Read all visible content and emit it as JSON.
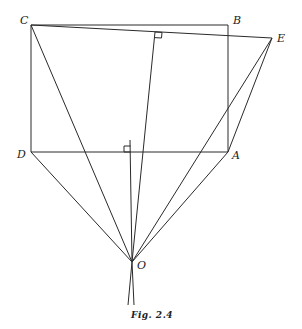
{
  "figure": {
    "caption": "Fig. 2.4",
    "points": {
      "C": {
        "label": "C",
        "x": 31,
        "y": 25
      },
      "B": {
        "label": "B",
        "x": 228,
        "y": 25
      },
      "E": {
        "label": "E",
        "x": 272,
        "y": 38
      },
      "D": {
        "label": "D",
        "x": 31,
        "y": 152
      },
      "A": {
        "label": "A",
        "x": 228,
        "y": 152
      },
      "O": {
        "label": "O",
        "x": 132,
        "y": 262
      }
    },
    "right_angle_marks": [
      "foot of perpendicular from O on CE",
      "foot of perpendicular from O on DA"
    ],
    "colors": {
      "line": "#2a2a2a",
      "background": "#ffffff"
    }
  }
}
